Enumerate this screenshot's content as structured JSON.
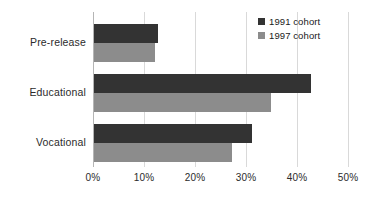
{
  "chart_data": {
    "type": "bar",
    "orientation": "horizontal",
    "title": "",
    "subtitle": "",
    "xlabel": "",
    "ylabel": "",
    "categories": [
      "Pre-release",
      "Educational",
      "Vocational"
    ],
    "series": [
      {
        "name": "1991 cohort",
        "color": "#333333",
        "values": [
          12.5,
          42.5,
          31.0
        ]
      },
      {
        "name": "1997 cohort",
        "color": "#8c8c8c",
        "values": [
          12.0,
          34.7,
          27.0
        ]
      }
    ],
    "xlim": [
      0,
      50
    ],
    "xticks": [
      0,
      10,
      20,
      30,
      40,
      50
    ],
    "xtick_labels": [
      "0%",
      "10%",
      "20%",
      "30%",
      "40%",
      "50%"
    ],
    "grid": true,
    "grid_axis": "x",
    "legend_position": "top-right",
    "legend_entries": [
      "1991 cohort",
      "1997 cohort"
    ],
    "annotations": []
  },
  "axis": {
    "tick_labels": [
      "0%",
      "10%",
      "20%",
      "30%",
      "40%",
      "50%"
    ],
    "category_labels": [
      "Pre-release",
      "Educational",
      "Vocational"
    ]
  },
  "legend": {
    "items": [
      {
        "label": "1991 cohort",
        "color": "#333333"
      },
      {
        "label": "1997 cohort",
        "color": "#8c8c8c"
      }
    ]
  },
  "colors": {
    "series_1991": "#333333",
    "series_1997": "#8c8c8c",
    "gridline": "#d9d9d9",
    "axis": "#b5b5b5",
    "background": "#ffffff",
    "text": "#2b2b2b"
  }
}
